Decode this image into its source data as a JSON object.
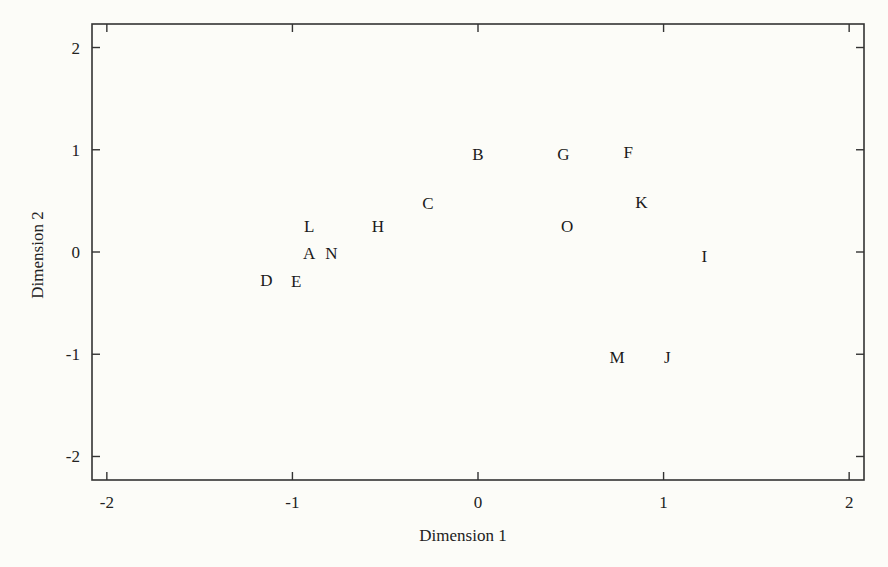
{
  "chart_data": {
    "type": "scatter",
    "title": "",
    "xlabel": "Dimension 1",
    "ylabel": "Dimension 2",
    "xlim": [
      -2.08,
      2.08
    ],
    "ylim": [
      -2.23,
      2.23
    ],
    "xticks": [
      -2,
      -1,
      0,
      1,
      2
    ],
    "yticks": [
      -2,
      -1,
      0,
      1,
      2
    ],
    "xtick_labels": [
      "-2",
      "-1",
      "0",
      "1",
      "2"
    ],
    "ytick_labels": [
      "-2",
      "-1",
      "0",
      "1",
      "2"
    ],
    "grid": false,
    "legend": null,
    "marker": "text-label",
    "points": [
      {
        "label": "A",
        "x": -0.91,
        "y": -0.01
      },
      {
        "label": "B",
        "x": 0.0,
        "y": 0.96
      },
      {
        "label": "C",
        "x": -0.27,
        "y": 0.48
      },
      {
        "label": "D",
        "x": -1.14,
        "y": -0.27
      },
      {
        "label": "E",
        "x": -0.98,
        "y": -0.28
      },
      {
        "label": "F",
        "x": 0.81,
        "y": 0.98
      },
      {
        "label": "G",
        "x": 0.46,
        "y": 0.96
      },
      {
        "label": "H",
        "x": -0.54,
        "y": 0.25
      },
      {
        "label": "I",
        "x": 1.22,
        "y": -0.04
      },
      {
        "label": "J",
        "x": 1.02,
        "y": -1.03
      },
      {
        "label": "K",
        "x": 0.88,
        "y": 0.49
      },
      {
        "label": "L",
        "x": -0.91,
        "y": 0.25
      },
      {
        "label": "M",
        "x": 0.75,
        "y": -1.03
      },
      {
        "label": "N",
        "x": -0.79,
        "y": -0.01
      },
      {
        "label": "O",
        "x": 0.48,
        "y": 0.25
      }
    ]
  },
  "colors": {
    "background": "#fcfcf8",
    "axis": "#333333",
    "text": "#222222"
  }
}
